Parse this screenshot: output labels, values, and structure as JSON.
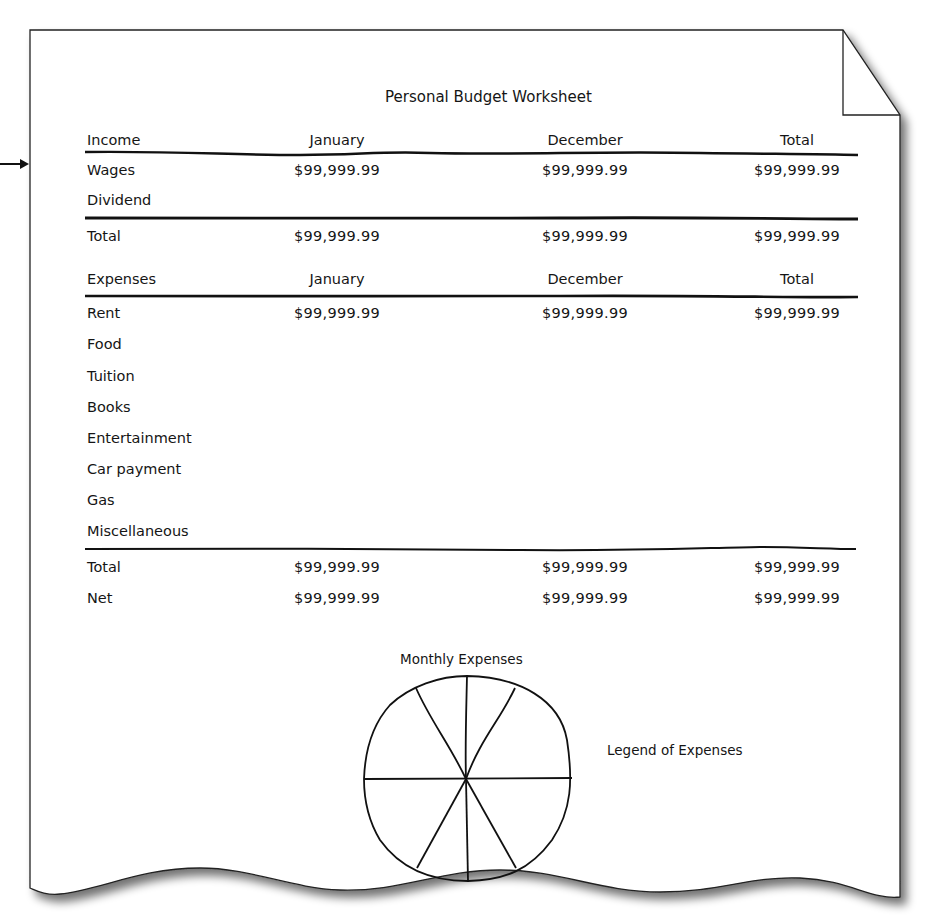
{
  "document": {
    "title": "Personal Budget Worksheet",
    "income_section": {
      "header": {
        "label": "Income",
        "col1": "January",
        "col2": "December",
        "col3": "Total"
      },
      "rows": [
        {
          "label": "Wages",
          "january": "$99,999.99",
          "december": "$99,999.99",
          "total": "$99,999.99"
        },
        {
          "label": "Dividend",
          "january": "",
          "december": "",
          "total": ""
        }
      ],
      "total": {
        "label": "Total",
        "january": "$99,999.99",
        "december": "$99,999.99",
        "total": "$99,999.99"
      }
    },
    "expenses_section": {
      "header": {
        "label": "Expenses",
        "col1": "January",
        "col2": "December",
        "col3": "Total"
      },
      "rows": [
        {
          "label": "Rent",
          "january": "$99,999.99",
          "december": "$99,999.99",
          "total": "$99,999.99"
        },
        {
          "label": "Food",
          "january": "",
          "december": "",
          "total": ""
        },
        {
          "label": "Tuition",
          "january": "",
          "december": "",
          "total": ""
        },
        {
          "label": "Books",
          "january": "",
          "december": "",
          "total": ""
        },
        {
          "label": "Entertainment",
          "january": "",
          "december": "",
          "total": ""
        },
        {
          "label": "Car payment",
          "january": "",
          "december": "",
          "total": ""
        },
        {
          "label": "Gas",
          "january": "",
          "december": "",
          "total": ""
        },
        {
          "label": "Miscellaneous",
          "january": "",
          "december": "",
          "total": ""
        }
      ],
      "total": {
        "label": "Total",
        "january": "$99,999.99",
        "december": "$99,999.99",
        "total": "$99,999.99"
      },
      "net": {
        "label": "Net",
        "january": "$99,999.99",
        "december": "$99,999.99",
        "total": "$99,999.99"
      }
    },
    "pie_chart": {
      "title": "Monthly Expenses",
      "legend_title": "Legend of Expenses",
      "slice_count": 8
    },
    "colors": {
      "ink": "#111111",
      "paper": "#ffffff",
      "shadow": "#9a9a9a"
    }
  }
}
